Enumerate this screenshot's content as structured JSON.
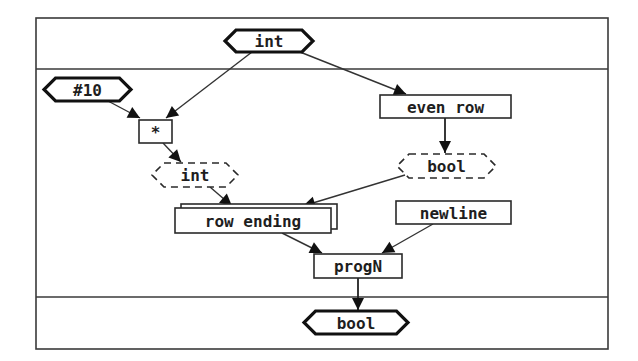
{
  "diagram": {
    "frame": {
      "left": 36,
      "top": 18,
      "right": 608,
      "bottom": 349,
      "divider_top": 69,
      "divider_bottom": 297
    },
    "nodes": {
      "input_int": {
        "label": "int",
        "shape": "hexagon",
        "x": 225,
        "y": 30,
        "w": 88,
        "h": 22
      },
      "const_10": {
        "label": "#10",
        "shape": "hexagon",
        "x": 44,
        "y": 78,
        "w": 87,
        "h": 23
      },
      "multiply": {
        "label": "*",
        "shape": "box",
        "x": 139,
        "y": 120,
        "w": 33,
        "h": 23
      },
      "int_result": {
        "label": "int",
        "shape": "dashed-hexagon",
        "x": 152,
        "y": 163,
        "w": 86,
        "h": 24
      },
      "even_row": {
        "label": "even row",
        "shape": "box",
        "x": 380,
        "y": 95,
        "w": 131,
        "h": 23
      },
      "bool_result": {
        "label": "bool",
        "shape": "dashed-hexagon",
        "x": 397,
        "y": 154,
        "w": 99,
        "h": 24
      },
      "row_ending": {
        "label": "row ending",
        "shape": "stacked-box",
        "x": 175,
        "y": 208,
        "w": 156,
        "h": 25
      },
      "newline": {
        "label": "newline",
        "shape": "box",
        "x": 396,
        "y": 201,
        "w": 115,
        "h": 23
      },
      "progN": {
        "label": "progN",
        "shape": "box",
        "x": 314,
        "y": 254,
        "w": 88,
        "h": 24
      },
      "output_bool": {
        "label": "bool",
        "shape": "hexagon",
        "x": 304,
        "y": 311,
        "w": 104,
        "h": 23
      }
    },
    "edges": [
      {
        "from": "input_int",
        "to": "multiply",
        "x1": 252,
        "y1": 52,
        "x2": 166,
        "y2": 118
      },
      {
        "from": "input_int",
        "to": "even_row",
        "x1": 300,
        "y1": 52,
        "x2": 406,
        "y2": 94
      },
      {
        "from": "const_10",
        "to": "multiply",
        "x1": 108,
        "y1": 101,
        "x2": 140,
        "y2": 118
      },
      {
        "from": "multiply",
        "to": "int_result",
        "x1": 163,
        "y1": 143,
        "x2": 181,
        "y2": 162
      },
      {
        "from": "even_row",
        "to": "bool_result",
        "x1": 445,
        "y1": 118,
        "x2": 445,
        "y2": 153
      },
      {
        "from": "int_result",
        "to": "row_ending",
        "x1": 210,
        "y1": 187,
        "x2": 232,
        "y2": 206
      },
      {
        "from": "bool_result",
        "to": "row_ending",
        "x1": 405,
        "y1": 175,
        "x2": 303,
        "y2": 206
      },
      {
        "from": "row_ending",
        "to": "progN",
        "x1": 282,
        "y1": 233,
        "x2": 322,
        "y2": 253
      },
      {
        "from": "newline",
        "to": "progN",
        "x1": 433,
        "y1": 224,
        "x2": 382,
        "y2": 253
      },
      {
        "from": "progN",
        "to": "output_bool",
        "x1": 358,
        "y1": 278,
        "x2": 358,
        "y2": 310
      }
    ]
  }
}
